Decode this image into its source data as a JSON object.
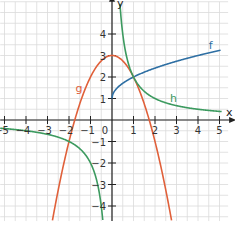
{
  "chart_data": {
    "type": "line",
    "title": "",
    "xlabel": "x",
    "ylabel": "y",
    "xlim": [
      -5.2,
      5.4
    ],
    "ylim": [
      -4.7,
      5.5
    ],
    "grid": true,
    "x_ticks": [
      -5,
      -4,
      -3,
      -2,
      -1,
      1,
      2,
      3,
      4,
      5
    ],
    "y_ticks": [
      -4,
      -3,
      -2,
      -1,
      1,
      2,
      3,
      4
    ],
    "origin_label": "0",
    "series": [
      {
        "name": "f",
        "color": "#2e6fa3",
        "formula": "sqrt(x)+1",
        "x": [
          0,
          0.25,
          0.5,
          1,
          2,
          3,
          4,
          5
        ],
        "values": [
          1,
          1.5,
          1.71,
          2,
          2.41,
          2.73,
          3,
          3.24
        ]
      },
      {
        "name": "g",
        "color": "#e0603a",
        "formula": "3-x^2",
        "x": [
          -2.8,
          -2,
          -1,
          0,
          1,
          2,
          2.8
        ],
        "values": [
          -4.84,
          -1,
          2,
          3,
          2,
          -1,
          -4.84
        ]
      },
      {
        "name": "h",
        "color": "#3c9a5f",
        "formula": "2/x",
        "x": [
          -5,
          -4,
          -2,
          -1,
          -0.5,
          0.45,
          1,
          2,
          4,
          5
        ],
        "values": [
          -0.4,
          -0.5,
          -1,
          -2,
          -4,
          4.44,
          2,
          1,
          0.5,
          0.4
        ]
      }
    ],
    "annotations": [
      {
        "text": "f",
        "x": 4.5,
        "y": 3.3
      },
      {
        "text": "g",
        "x": -1.7,
        "y": 1.3
      },
      {
        "text": "h",
        "x": 2.7,
        "y": 0.85
      }
    ]
  },
  "labels": {
    "x_axis": "x",
    "y_axis": "y",
    "origin": "0",
    "f": "f",
    "g": "g",
    "h": "h"
  }
}
